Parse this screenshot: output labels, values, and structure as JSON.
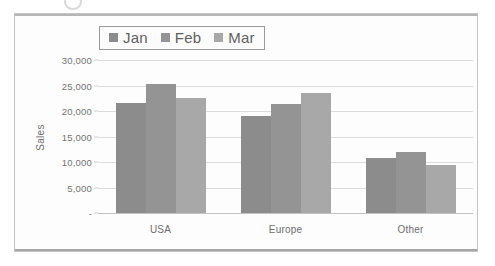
{
  "chart_data": {
    "type": "bar",
    "title": "",
    "xlabel": "",
    "ylabel": "Sales",
    "categories": [
      "USA",
      "Europe",
      "Other"
    ],
    "series": [
      {
        "name": "Jan",
        "values": [
          21500,
          19000,
          10800
        ],
        "color": "#8c8c8c"
      },
      {
        "name": "Feb",
        "values": [
          25200,
          21300,
          11900
        ],
        "color": "#949494"
      },
      {
        "name": "Mar",
        "values": [
          22500,
          23500,
          9500
        ],
        "color": "#a8a8a8"
      }
    ],
    "ylim": [
      0,
      30000
    ],
    "yticks": [
      0,
      5000,
      10000,
      15000,
      20000,
      25000,
      30000
    ],
    "ytick_labels": [
      "-",
      "5,000",
      "10,000",
      "15,000",
      "20,000",
      "25,000",
      "30,000"
    ],
    "grid": true,
    "legend_position": "top-center"
  },
  "legend": {
    "entries": [
      {
        "label": "Jan"
      },
      {
        "label": "Feb"
      },
      {
        "label": "Mar"
      }
    ]
  },
  "axis": {
    "y_title": "Sales"
  }
}
